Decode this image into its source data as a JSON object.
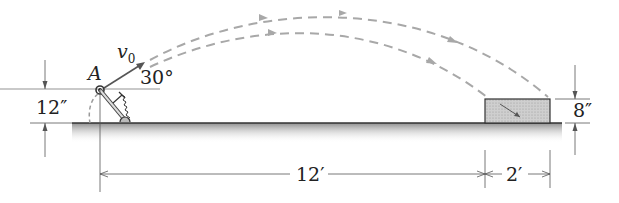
{
  "diagram": {
    "labels": {
      "point": "A",
      "velocity": "v",
      "velocity_sub": "0",
      "angle": "30°",
      "height_launch": "12″",
      "height_box": "8″",
      "distance_main": "12′",
      "distance_box": "2′"
    },
    "colors": {
      "ink": "#333333",
      "trajectory": "#a8a8a8",
      "ground_top": "#8c8c8c",
      "box_fill": "#c9c9c9"
    }
  }
}
